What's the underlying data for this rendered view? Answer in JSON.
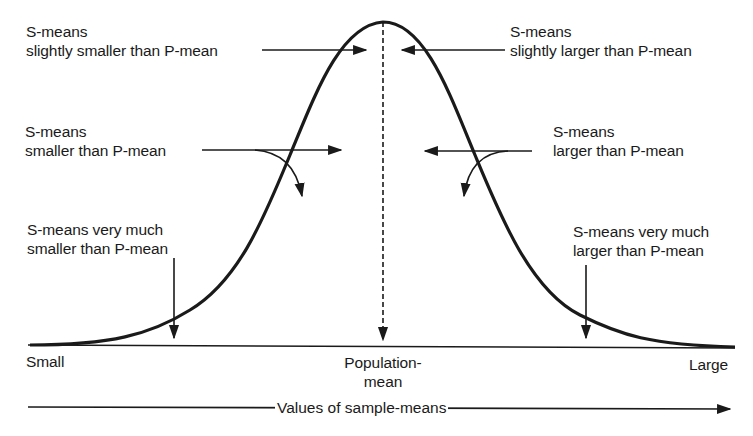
{
  "diagram": {
    "type": "normal-distribution-of-sample-means",
    "annotations": {
      "slightly_smaller": {
        "line1": "S-means",
        "line2": "slightly smaller than P-mean"
      },
      "slightly_larger": {
        "line1": "S-means",
        "line2": "slightly larger than P-mean"
      },
      "smaller": {
        "line1": "S-means",
        "line2": "smaller than P-mean"
      },
      "larger": {
        "line1": "S-means",
        "line2": "larger than P-mean"
      },
      "very_much_smaller": {
        "line1": "S-means very much",
        "line2": "smaller than P-mean"
      },
      "very_much_larger": {
        "line1": "S-means very much",
        "line2": "larger than P-mean"
      }
    },
    "axis": {
      "left_label": "Small",
      "center_label_line1": "Population-",
      "center_label_line2": "mean",
      "right_label": "Large",
      "title": "Values of sample-means"
    },
    "colors": {
      "ink": "#1a1a1a",
      "background": "#ffffff"
    }
  }
}
